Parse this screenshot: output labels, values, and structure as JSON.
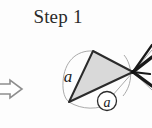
{
  "figure": {
    "title": "Step 1",
    "background_color": "#fdfdfd",
    "labels": {
      "side_label": "a",
      "angle_label": "a"
    },
    "icons": {
      "transition_arrow": "right-arrow-outline-icon"
    },
    "colors": {
      "triangle_fill": "#d9d9d9",
      "triangle_stroke": "#2b2b2b",
      "thin_line": "#9a9a9a",
      "thick_line": "#1a1a1a",
      "text": "#2a2a2a",
      "arrow_stroke": "#8c8c8c",
      "arrow_fill": "#ffffff"
    },
    "geometry": {
      "triangle_apex": [
        93,
        51
      ],
      "triangle_bottom_left": [
        69,
        102
      ],
      "triangle_right": [
        133,
        72
      ],
      "convergence_point": [
        133,
        72
      ],
      "side_arc_label_pos": [
        68,
        77
      ],
      "angle_circle_center": [
        107,
        101
      ],
      "angle_circle_radius": 9
    }
  }
}
